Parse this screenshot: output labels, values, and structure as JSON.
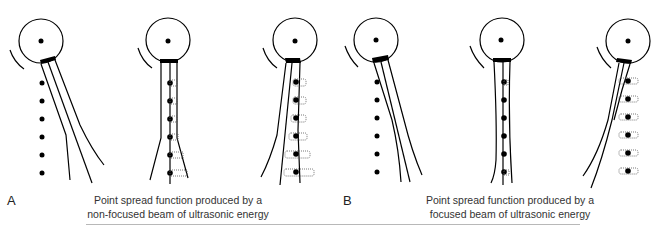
{
  "panels": [
    {
      "id": "A",
      "label": "A",
      "caption_line1": "Point spread function produced by a",
      "caption_line2": "non-focused beam of ultrasonic energy",
      "beam_type": "non-focused"
    },
    {
      "id": "B",
      "label": "B",
      "caption_line1": "Point spread function produced by a",
      "caption_line2": "focused beam of ultrasonic energy",
      "beam_type": "focused"
    }
  ],
  "figures_per_panel": 3,
  "point_targets_per_figure": 6,
  "colors": {
    "ink": "#000000",
    "caption_text": "#333333",
    "rule": "#b8b8b8",
    "psf_dotted": "#555555"
  }
}
